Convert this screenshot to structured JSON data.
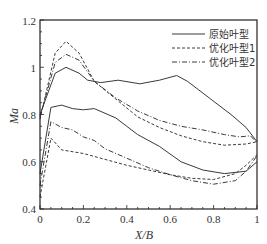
{
  "chart_data": {
    "type": "line",
    "title": "",
    "xlabel": "X/B",
    "ylabel": "Ma",
    "xlim": [
      0,
      1
    ],
    "ylim": [
      0.4,
      1.2
    ],
    "xticks": [
      "0",
      "0.2",
      "0.4",
      "0.6",
      "0.8",
      "1"
    ],
    "yticks": [
      "0.4",
      "0.6",
      "0.8",
      "1",
      "1.2"
    ],
    "grid": false,
    "legend_position": "upper right",
    "series": [
      {
        "name": "原始叶型",
        "style": "solid",
        "surface": "suction",
        "x": [
          0.0,
          0.07,
          0.12,
          0.18,
          0.22,
          0.28,
          0.36,
          0.46,
          0.55,
          0.63,
          0.68,
          0.78,
          0.88,
          0.95,
          1.0
        ],
        "y": [
          0.8,
          0.975,
          1.0,
          0.975,
          0.945,
          0.935,
          0.945,
          0.93,
          0.945,
          0.965,
          0.94,
          0.87,
          0.8,
          0.745,
          0.685
        ]
      },
      {
        "name": "原始叶型",
        "style": "solid",
        "surface": "pressure",
        "x": [
          0.0,
          0.05,
          0.1,
          0.15,
          0.2,
          0.25,
          0.35,
          0.45,
          0.55,
          0.65,
          0.75,
          0.85,
          0.95,
          1.0
        ],
        "y": [
          0.55,
          0.83,
          0.84,
          0.825,
          0.82,
          0.825,
          0.785,
          0.715,
          0.665,
          0.6,
          0.565,
          0.55,
          0.56,
          0.6
        ]
      },
      {
        "name": "优化叶型1",
        "style": "dashed",
        "surface": "suction",
        "x": [
          0.0,
          0.07,
          0.12,
          0.18,
          0.25,
          0.35,
          0.45,
          0.55,
          0.65,
          0.75,
          0.85,
          0.95,
          1.0
        ],
        "y": [
          0.78,
          1.06,
          1.11,
          1.06,
          0.94,
          0.865,
          0.79,
          0.745,
          0.71,
          0.685,
          0.67,
          0.675,
          0.685
        ]
      },
      {
        "name": "优化叶型1",
        "style": "dashed",
        "surface": "pressure",
        "x": [
          0.0,
          0.05,
          0.1,
          0.2,
          0.3,
          0.4,
          0.5,
          0.6,
          0.7,
          0.8,
          0.9,
          0.95,
          1.0
        ],
        "y": [
          0.45,
          0.7,
          0.65,
          0.635,
          0.61,
          0.585,
          0.565,
          0.545,
          0.53,
          0.525,
          0.55,
          0.585,
          0.63
        ]
      },
      {
        "name": "优化叶型2",
        "style": "dashdot",
        "surface": "suction",
        "x": [
          0.0,
          0.07,
          0.12,
          0.18,
          0.25,
          0.35,
          0.45,
          0.55,
          0.65,
          0.75,
          0.85,
          0.92,
          0.97,
          1.0
        ],
        "y": [
          0.79,
          1.02,
          1.055,
          1.03,
          0.94,
          0.87,
          0.815,
          0.775,
          0.75,
          0.735,
          0.715,
          0.705,
          0.71,
          0.68
        ]
      },
      {
        "name": "优化叶型2",
        "style": "dashdot",
        "surface": "pressure",
        "x": [
          0.0,
          0.05,
          0.1,
          0.15,
          0.2,
          0.25,
          0.3,
          0.4,
          0.5,
          0.6,
          0.7,
          0.8,
          0.9,
          0.95,
          1.0
        ],
        "y": [
          0.5,
          0.77,
          0.745,
          0.735,
          0.705,
          0.69,
          0.655,
          0.615,
          0.575,
          0.545,
          0.52,
          0.505,
          0.52,
          0.56,
          0.625
        ]
      }
    ],
    "legend": [
      "原始叶型",
      "优化叶型1",
      "优化叶型2"
    ]
  },
  "axes": {
    "xlabel": "X/B",
    "ylabel": "Ma",
    "xticks": [
      "0",
      "0.2",
      "0.4",
      "0.6",
      "0.8",
      "1"
    ],
    "yticks": [
      "0.4",
      "0.6",
      "0.8",
      "1",
      "1.2"
    ]
  },
  "legend": {
    "items": [
      {
        "label": "原始叶型",
        "style": "solid"
      },
      {
        "label": "优化叶型1",
        "style": "dashed"
      },
      {
        "label": "优化叶型2",
        "style": "dashdot"
      }
    ]
  },
  "colors": {
    "line": "#3a3a3a",
    "axis": "#222222",
    "background": "#ffffff"
  }
}
